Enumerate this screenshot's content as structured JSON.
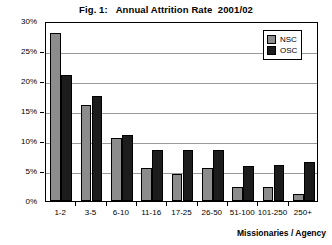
{
  "chart_data": {
    "type": "bar",
    "title": "Fig. 1:   Annual Attrition Rate  2001/02",
    "xlabel": "Missionaries / Agency",
    "ylabel": "",
    "categories": [
      "1-2",
      "3-5",
      "6-10",
      "11-16",
      "17-25",
      "26-50",
      "51-100",
      "101-250",
      "250+"
    ],
    "series": [
      {
        "name": "NSC",
        "color": "#8c8c8c",
        "values": [
          28.0,
          16.0,
          10.5,
          5.5,
          4.5,
          5.5,
          2.3,
          2.3,
          1.2
        ]
      },
      {
        "name": "OSC",
        "color": "#1c1c1c",
        "values": [
          21.0,
          17.5,
          11.0,
          8.5,
          8.5,
          8.5,
          5.8,
          6.0,
          6.5
        ]
      }
    ],
    "ylim": [
      0,
      30
    ],
    "ytick_labels": [
      "0%",
      "5%",
      "10%",
      "15%",
      "20%",
      "25%",
      "30%"
    ],
    "ytick_values": [
      0,
      5,
      10,
      15,
      20,
      25,
      30
    ],
    "grid": true,
    "legend_position": "top-right"
  }
}
